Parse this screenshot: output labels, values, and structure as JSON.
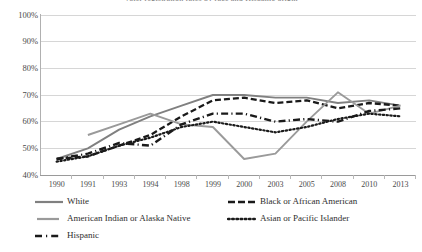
{
  "chart_data": {
    "type": "line",
    "title": "Voter registration rates by race and Hispanic origin",
    "xlabel": "",
    "ylabel": "",
    "ylim": [
      40,
      100
    ],
    "ytick_labels": [
      "100%",
      "90%",
      "80%",
      "70%",
      "60%",
      "50%",
      "40%"
    ],
    "ytick_values": [
      100,
      90,
      80,
      70,
      60,
      50,
      40
    ],
    "grid": "horizontal",
    "legend_position": "bottom-left",
    "categories": [
      "1990",
      "1991",
      "1993",
      "1994",
      "1998",
      "1999",
      "2000",
      "2003",
      "2005",
      "2008",
      "2010",
      "2013"
    ],
    "series": [
      {
        "name": "White",
        "style": "solid",
        "color": "#808080",
        "values": [
          46,
          50,
          57,
          62,
          66,
          70,
          70,
          69,
          69,
          67,
          68,
          66
        ]
      },
      {
        "name": "Black or African American",
        "style": "dashed",
        "color": "#1a1a1a",
        "values": [
          46,
          47,
          51,
          55,
          62,
          68,
          69,
          67,
          68,
          65,
          67,
          66
        ]
      },
      {
        "name": "American Indian or Alaska Native",
        "style": "solid",
        "color": "#9a9a9a",
        "values": [
          null,
          55,
          59,
          63,
          59,
          58,
          46,
          48,
          60,
          71,
          63,
          66
        ],
        "values_note": "sharp dips at 1998 and 2000, spike at 2005"
      },
      {
        "name": "Asian or Pacific Islander",
        "style": "dotted",
        "color": "#1a1a1a",
        "values": [
          45,
          47,
          51,
          54,
          58,
          60,
          58,
          56,
          58,
          61,
          63,
          62
        ]
      },
      {
        "name": "Hispanic",
        "style": "dash-dot",
        "color": "#1a1a1a",
        "values": [
          46,
          48,
          52,
          51,
          59,
          63,
          63,
          60,
          61,
          60,
          64,
          65
        ]
      }
    ]
  },
  "legend": {
    "items": [
      {
        "label": "White",
        "icon": "solid-line-swatch"
      },
      {
        "label": "Black or African American",
        "icon": "dashed-line-swatch"
      },
      {
        "label": "American Indian or Alaska Native",
        "icon": "solid-line-swatch"
      },
      {
        "label": "Asian or Pacific Islander",
        "icon": "dotted-line-swatch"
      },
      {
        "label": "Hispanic",
        "icon": "dash-dot-line-swatch"
      }
    ]
  }
}
